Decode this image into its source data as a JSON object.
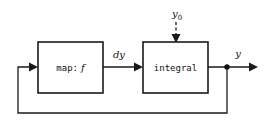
{
  "diagram": {
    "type": "block-diagram",
    "title": "",
    "background_color": "#ffffff",
    "line_color": "#1a1a1a",
    "blocks": [
      {
        "id": "map",
        "label": "map: f",
        "label_plain": "map:",
        "label_italic": "f",
        "x": 38,
        "y": 42,
        "width": 65,
        "height": 51
      },
      {
        "id": "integral",
        "label": "integral",
        "x": 143,
        "y": 42,
        "width": 65,
        "height": 51
      }
    ],
    "signals": [
      {
        "id": "dy",
        "label": "dy",
        "from": "map",
        "to": "integral",
        "style": "solid"
      },
      {
        "id": "y0",
        "label": "y",
        "subscript": "0",
        "from": "external",
        "to": "integral",
        "style": "dashed",
        "direction": "down"
      },
      {
        "id": "y",
        "label": "y",
        "from": "integral",
        "to": "output",
        "style": "solid"
      },
      {
        "id": "feedback",
        "label": "",
        "from": "y-junction",
        "to": "map",
        "style": "solid"
      }
    ],
    "junctions": [
      {
        "id": "y-junction",
        "x": 227,
        "y": 67
      }
    ]
  }
}
